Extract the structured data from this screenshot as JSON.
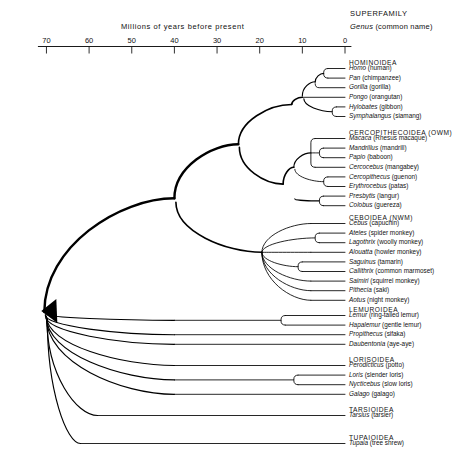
{
  "axis": {
    "title": "Millions of years before present",
    "ticks": [
      70,
      60,
      50,
      40,
      30,
      20,
      10,
      0
    ],
    "min": 0,
    "max": 72
  },
  "legend": {
    "line1": "SUPERFAMILY",
    "genus": "Genus",
    "common": "(common name)"
  },
  "chart_data": {
    "type": "tree",
    "xlabel": "Millions of years before present",
    "xlim": [
      72,
      0
    ],
    "grid": false,
    "root_age": 70,
    "groups": [
      {
        "superfamily": "HOMINOIDEA",
        "crown_age": 12,
        "taxa": [
          {
            "genus": "Homo",
            "common": "(human)",
            "divergence": 5
          },
          {
            "genus": "Pan",
            "common": "(chimpanzee)",
            "divergence": 5
          },
          {
            "genus": "Gorilla",
            "common": "(gorilla)",
            "divergence": 7
          },
          {
            "genus": "Pongo",
            "common": "(orangutan)",
            "divergence": 10
          },
          {
            "genus": "Hylobates",
            "common": "(gibbon)",
            "divergence": 3
          },
          {
            "genus": "Symphalangus",
            "common": "(siamang)",
            "divergence": 3
          }
        ]
      },
      {
        "superfamily": "CERCOPITHECOIDEA",
        "superfamily_note": "(OWM)",
        "crown_age": 14,
        "taxa": [
          {
            "genus": "Macaca",
            "common": "(Rhesus macaque)",
            "divergence": 8
          },
          {
            "genus": "Mandrillus",
            "common": "(mandrill)",
            "divergence": 6
          },
          {
            "genus": "Papio",
            "common": "(baboon)",
            "divergence": 6
          },
          {
            "genus": "Cercocebus",
            "common": "(mangabey)",
            "divergence": 8
          },
          {
            "genus": "Cercopithecus",
            "common": "(guenon)",
            "divergence": 5
          },
          {
            "genus": "Erythrocebus",
            "common": "(patas)",
            "divergence": 5
          },
          {
            "genus": "Presbytis",
            "common": "(langur)",
            "divergence": 6
          },
          {
            "genus": "Colobus",
            "common": "(guereza)",
            "divergence": 6
          }
        ]
      },
      {
        "superfamily": "CEBOIDEA",
        "superfamily_note": "(NWM)",
        "crown_age": 16,
        "taxa": [
          {
            "genus": "Cebus",
            "common": "(capuchin)",
            "divergence": 16
          },
          {
            "genus": "Ateles",
            "common": "(spider monkey)",
            "divergence": 7
          },
          {
            "genus": "Lagothrix",
            "common": "(woolly monkey)",
            "divergence": 7
          },
          {
            "genus": "Alouatta",
            "common": "(howler monkey)",
            "divergence": 16
          },
          {
            "genus": "Saguinus",
            "common": "(tamarin)",
            "divergence": 11
          },
          {
            "genus": "Callithrix",
            "common": "(common marmoset)",
            "divergence": 11
          },
          {
            "genus": "Saimiri",
            "common": "(squirrel monkey)",
            "divergence": 16
          },
          {
            "genus": "Pithecia",
            "common": "(saki)",
            "divergence": 16
          },
          {
            "genus": "Aotus",
            "common": "(night monkey)",
            "divergence": 16
          }
        ]
      },
      {
        "superfamily": "LEMUROIDEA",
        "crown_age": 40,
        "taxa": [
          {
            "genus": "Lemur",
            "common": "(ring-tailed lemur)",
            "divergence": 15
          },
          {
            "genus": "Hapalemur",
            "common": "(gentle lemur)",
            "divergence": 15
          },
          {
            "genus": "Propithecus",
            "common": "(sifaka)",
            "divergence": 40
          },
          {
            "genus": "Daubentonia",
            "common": "(aye-aye)",
            "divergence": 40
          }
        ]
      },
      {
        "superfamily": "LORISOIDEA",
        "crown_age": 40,
        "taxa": [
          {
            "genus": "Perodicticus",
            "common": "(potto)",
            "divergence": 40
          },
          {
            "genus": "Loris",
            "common": "(slender loris)",
            "divergence": 12
          },
          {
            "genus": "Nycticebus",
            "common": "(slow loris)",
            "divergence": 12
          },
          {
            "genus": "Galago",
            "common": "(galago)",
            "divergence": 40
          }
        ]
      },
      {
        "superfamily": "TARSIOIDEA",
        "crown_age": 60,
        "taxa": [
          {
            "genus": "Tarsius",
            "common": "(tarsier)",
            "divergence": 60
          }
        ]
      },
      {
        "superfamily": "TUPAIOIDEA",
        "crown_age": 70,
        "taxa": [
          {
            "genus": "Tupaia",
            "common": "(tree shrew)",
            "divergence": 70
          }
        ]
      }
    ]
  }
}
